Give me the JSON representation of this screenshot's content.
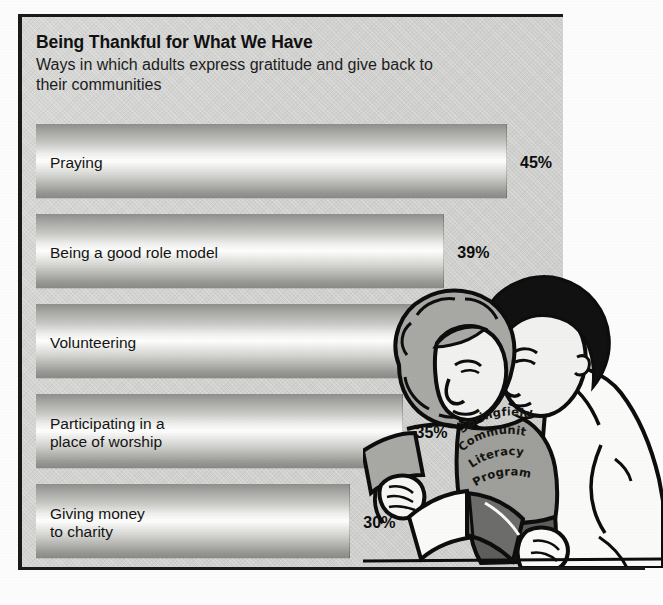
{
  "heading": {
    "title": "Being Thankful for What We Have",
    "subtitle": "Ways in which adults express gratitude\nand give back to their communities"
  },
  "illustration": {
    "name": "two-adults-reading-together",
    "shirt_text_lines": [
      "Springfield",
      "Community",
      "Literacy",
      "Program"
    ],
    "description": "Line-art drawing of a woman with curly hair and a man leaning together over an open book"
  },
  "colors": {
    "panel_background": "#d4d4d2",
    "frame_rule": "#1a1a1a",
    "text": "#111111",
    "bar_highlight": "#ffffff",
    "bar_shadow": "#8a8a87",
    "page_background": "#fdfdfd"
  },
  "chart_data": {
    "type": "bar",
    "title": "Being Thankful for What We Have",
    "subtitle": "Ways in which adults express gratitude and give back to their communities",
    "orientation": "horizontal",
    "xlabel": "",
    "ylabel": "",
    "xlim": [
      0,
      45
    ],
    "grid": false,
    "legend": "none",
    "value_suffix": "%",
    "categories": [
      "Praying",
      "Being a good role model",
      "Volunteering",
      "Participating in a place of worship",
      "Giving money to charity"
    ],
    "values": [
      45,
      39,
      36,
      35,
      30
    ],
    "value_labels": [
      "45%",
      "39%",
      "36%",
      "35%",
      "30%"
    ],
    "bars": [
      {
        "label": "Praying",
        "label_lines": [
          "Praying"
        ],
        "value": 45,
        "value_label": "45%"
      },
      {
        "label": "Being a good role model",
        "label_lines": [
          "Being a good role model"
        ],
        "value": 39,
        "value_label": "39%"
      },
      {
        "label": "Volunteering",
        "label_lines": [
          "Volunteering"
        ],
        "value": 36,
        "value_label": "36%"
      },
      {
        "label": "Participating in a place of worship",
        "label_lines": [
          "Participating in a",
          "place of worship"
        ],
        "value": 35,
        "value_label": "35%"
      },
      {
        "label": "Giving money to charity",
        "label_lines": [
          "Giving money",
          "to charity"
        ],
        "value": 30,
        "value_label": "30%"
      }
    ]
  }
}
